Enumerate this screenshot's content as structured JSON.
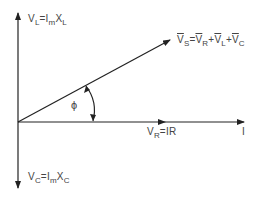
{
  "diagram": {
    "type": "phasor-diagram",
    "labels": {
      "vl": {
        "base": "V",
        "sub": "L",
        "eq": "=",
        "i": "I",
        "i_sub": "m",
        "x": "X",
        "x_sub": "L"
      },
      "vc": {
        "base": "V",
        "sub": "C",
        "eq": "=",
        "i": "I",
        "i_sub": "m",
        "x": "X",
        "x_sub": "C"
      },
      "vr": {
        "base": "V",
        "sub": "R",
        "eq": "=",
        "rhs": "IR"
      },
      "current": "I",
      "phi": "ϕ",
      "vs": {
        "v1": "V",
        "s1": "S",
        "eq": "=",
        "v2": "V",
        "s2": "R",
        "p1": "+",
        "v3": "V",
        "s3": "L",
        "p2": "+",
        "v4": "V",
        "s4": "C"
      }
    },
    "colors": {
      "line": "#222222",
      "text": "#444444"
    }
  }
}
